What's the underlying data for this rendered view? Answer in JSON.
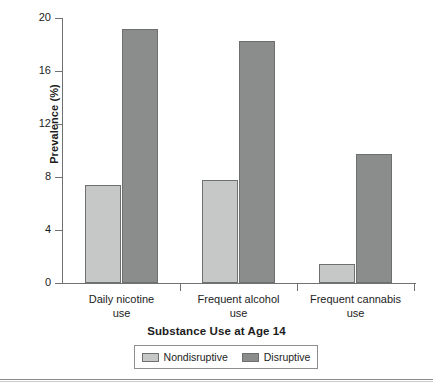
{
  "chart_data": {
    "type": "bar",
    "title": "",
    "xlabel": "Substance Use at Age 14",
    "ylabel": "Prevalence (%)",
    "categories": [
      "Daily nicotine use",
      "Frequent alcohol use",
      "Frequent cannabis use"
    ],
    "category_lines": [
      [
        "Daily nicotine",
        "use"
      ],
      [
        "Frequent alcohol",
        "use"
      ],
      [
        "Frequent cannabis",
        "use"
      ]
    ],
    "series": [
      {
        "name": "Nondisruptive",
        "color": "#c6c7c7",
        "values": [
          7.4,
          7.8,
          1.4
        ]
      },
      {
        "name": "Disruptive",
        "color": "#8b8c8c",
        "values": [
          19.2,
          18.3,
          9.7
        ]
      }
    ],
    "ylim": [
      0,
      20
    ],
    "yticks": [
      0,
      4,
      8,
      12,
      16,
      20
    ],
    "ytick_labels": [
      "0",
      "4",
      "8",
      "12",
      "16",
      "20"
    ],
    "grid": false,
    "legend_position": "bottom"
  },
  "legend": {
    "entries": [
      {
        "label": "Nondisruptive"
      },
      {
        "label": "Disruptive"
      }
    ]
  }
}
